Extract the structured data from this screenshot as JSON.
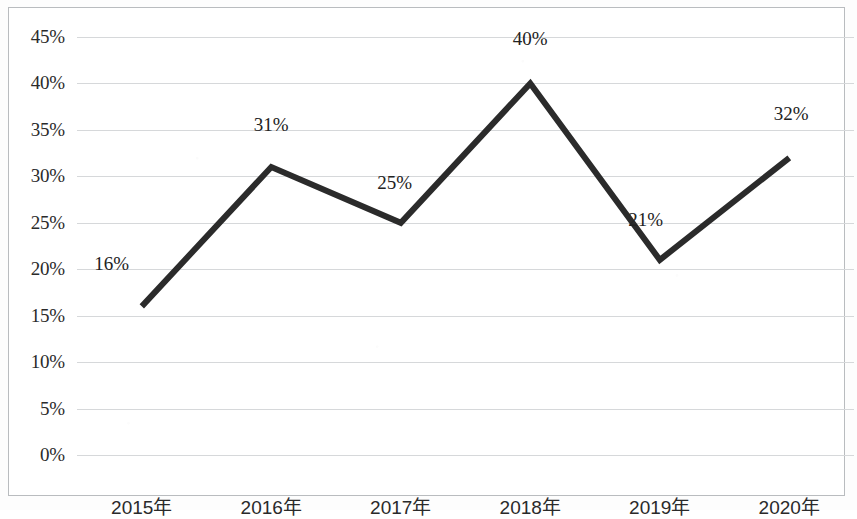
{
  "chart_data": {
    "type": "line",
    "title": "",
    "xlabel": "",
    "ylabel": "",
    "categories": [
      "2015年",
      "2016年",
      "2017年",
      "2018年",
      "2019年",
      "2020年"
    ],
    "values": [
      16,
      31,
      25,
      40,
      21,
      32
    ],
    "point_labels": [
      "16%",
      "31%",
      "25%",
      "40%",
      "21%",
      "32%"
    ],
    "ylim": [
      0,
      45
    ],
    "ytick_step": 5,
    "ytick_labels": [
      "0%",
      "5%",
      "10%",
      "15%",
      "20%",
      "25%",
      "30%",
      "35%",
      "40%",
      "45%"
    ],
    "ytick_values": [
      0,
      5,
      10,
      15,
      20,
      25,
      30,
      35,
      40,
      45
    ],
    "grid": true,
    "grid_axis": "y",
    "legend": false,
    "legend_position": "none",
    "series_color": "#2b2b2b",
    "grid_color": "#d6d8da",
    "border_color": "#b9bcbf",
    "background_color": "#ffffff",
    "line_width": 6,
    "markers": false
  }
}
